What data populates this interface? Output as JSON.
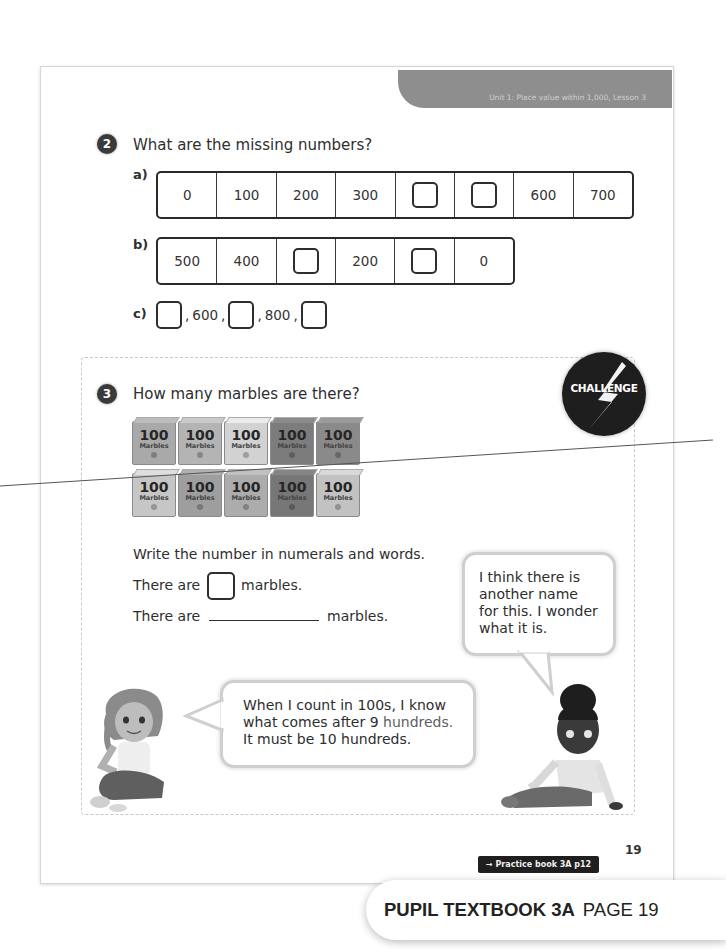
{
  "header": {
    "unit_banner": "Unit 1: Place value within 1,000, Lesson 3"
  },
  "question2": {
    "number": "2",
    "prompt": "What are the missing numbers?",
    "part_a": {
      "label": "a)",
      "cells": [
        "0",
        "100",
        "200",
        "300",
        "",
        "",
        "600",
        "700"
      ],
      "blanks": [
        4,
        5
      ]
    },
    "part_b": {
      "label": "b)",
      "cells": [
        "500",
        "400",
        "",
        "200",
        "",
        "0"
      ],
      "blanks": [
        2,
        4
      ]
    },
    "part_c": {
      "label": "c)",
      "items": [
        "",
        "600",
        "",
        "800",
        ""
      ],
      "separator": ","
    }
  },
  "question3": {
    "number": "3",
    "prompt": "How many marbles are there?",
    "challenge_badge": "CHALLENGE",
    "marble_box": {
      "number": "100",
      "word": "Marbles"
    },
    "marble_rows": [
      [
        "#a9a9a9",
        "#b4b4b4",
        "#d2d2d2",
        "#7c7c7c",
        "#8a8a8a"
      ],
      [
        "#c6c6c6",
        "#9e9e9e",
        "#acacac",
        "#777777",
        "#c2c2c2"
      ]
    ],
    "instruction": "Write the number in numerals and words.",
    "line1_before": "There are",
    "line1_after": "marbles.",
    "line2_before": "There are",
    "line2_after": "marbles."
  },
  "speech": {
    "right_bubble": [
      "I think there is",
      "another name",
      "for this. I wonder",
      "what it is."
    ],
    "left_bubble": {
      "line1": "When I count in 100s, I know",
      "line2_a": "what comes after 9 ",
      "line2_b": "hundreds.",
      "line3": "It must be 10 hundreds."
    }
  },
  "footer": {
    "page_number": "19",
    "practice_link": "→ Practice book 3A p12",
    "book_title": "PUPIL TEXTBOOK 3A",
    "page_label": "PAGE 19"
  }
}
